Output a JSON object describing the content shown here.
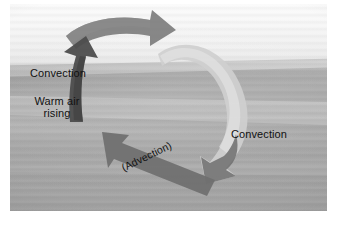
{
  "figure": {
    "kind": "photograph-with-overlay-arrows",
    "frame": {
      "background": "#ffffff",
      "photo_left": 10,
      "photo_top": 4,
      "photo_width": 317,
      "photo_height": 207
    }
  },
  "labels": {
    "convection_left": "Convection",
    "warm_air_rising": "Warm air rising",
    "convection_right": "Convection",
    "advection": "(Advection)"
  },
  "arrows": [
    {
      "name": "top-arrow",
      "direction": "rightward",
      "description": "Curved ribbon arrow across the top, pointing right",
      "color": "#7b7b7b"
    },
    {
      "name": "right-arrow",
      "direction": "descending",
      "description": "Light ribbon arrow curving down the right side, hooking left at the bottom",
      "color": "#c6c6c6"
    },
    {
      "name": "bottom-arrow",
      "direction": "up-left",
      "description": "Straight diagonal arrow across the bottom pointing up-left, labelled Advection",
      "color": "#6f6f6f"
    },
    {
      "name": "left-arrow",
      "direction": "upward",
      "description": "Dark ribbon arrow rising on the left side, labelled Warm air rising",
      "color": "#4a4a4a"
    }
  ],
  "colors": {
    "sky": "#f7f7f7",
    "haze": "#e6e6e6",
    "hills": "#a9a9a9",
    "ground": "#a3a3a3",
    "arrow_dark": "#4a4a4a",
    "arrow_mid": "#777777",
    "arrow_light": "#c6c6c6",
    "text": "#111111",
    "frame": "#ffffff"
  }
}
